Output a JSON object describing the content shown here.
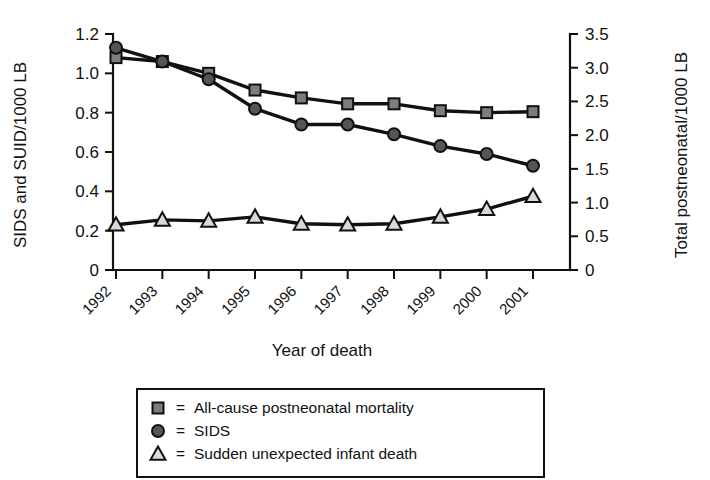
{
  "chart_data": {
    "type": "line",
    "title": "",
    "xlabel": "Year of death",
    "ylabel": "SIDS and SUID/1000 LB",
    "y2label": "Total postneonatal/1000 LB",
    "grid": false,
    "legend_position": "below-plot",
    "categories": [
      "1992",
      "1993",
      "1994",
      "1995",
      "1996",
      "1997",
      "1998",
      "1999",
      "2000",
      "2001"
    ],
    "x": [
      1992,
      1993,
      1994,
      1995,
      1996,
      1997,
      1998,
      1999,
      2000,
      2001
    ],
    "ylim": [
      0,
      1.2
    ],
    "yticks": [
      "0",
      "0.2",
      "0.4",
      "0.6",
      "0.8",
      "1.0",
      "1.2"
    ],
    "ytick_values": [
      0,
      0.2,
      0.4,
      0.6,
      0.8,
      1.0,
      1.2
    ],
    "y2lim": [
      0,
      3.5
    ],
    "y2ticks": [
      "0",
      "0.5",
      "1.0",
      "1.5",
      "2.0",
      "2.5",
      "3.0",
      "3.5"
    ],
    "y2tick_values": [
      0,
      0.5,
      1.0,
      1.5,
      2.0,
      2.5,
      3.0,
      3.5
    ],
    "series": [
      {
        "name": "All-cause postneonatal mortality",
        "marker": "square",
        "marker_fill": "#7d7d7d",
        "axis": "right",
        "values": [
          1.08,
          1.06,
          1.0,
          0.915,
          0.875,
          0.845,
          0.845,
          0.81,
          0.8,
          0.805
        ],
        "values_right_axis": [
          3.15,
          3.09,
          2.92,
          2.67,
          2.55,
          2.46,
          2.46,
          2.36,
          2.33,
          2.35
        ]
      },
      {
        "name": "SIDS",
        "marker": "circle",
        "marker_fill": "#555555",
        "axis": "left",
        "values": [
          1.13,
          1.06,
          0.97,
          0.82,
          0.74,
          0.74,
          0.69,
          0.63,
          0.59,
          0.53
        ]
      },
      {
        "name": "Sudden unexpected infant death",
        "marker": "triangle",
        "marker_fill": "#d9d9d9",
        "axis": "left",
        "values": [
          0.23,
          0.255,
          0.25,
          0.27,
          0.235,
          0.23,
          0.235,
          0.27,
          0.31,
          0.375
        ]
      }
    ]
  },
  "legend": {
    "equals": "=",
    "entries": [
      {
        "symbol": "square-marker-icon",
        "label": "All-cause postneonatal mortality"
      },
      {
        "symbol": "circle-marker-icon",
        "label": "SIDS"
      },
      {
        "symbol": "triangle-marker-icon",
        "label": "Sudden unexpected infant death"
      }
    ]
  },
  "colors": {
    "axis": "#111111",
    "line": "#111111",
    "square_fill": "#7d7d7d",
    "circle_fill": "#555555",
    "triangle_fill": "#d9d9d9",
    "background": "#ffffff"
  }
}
